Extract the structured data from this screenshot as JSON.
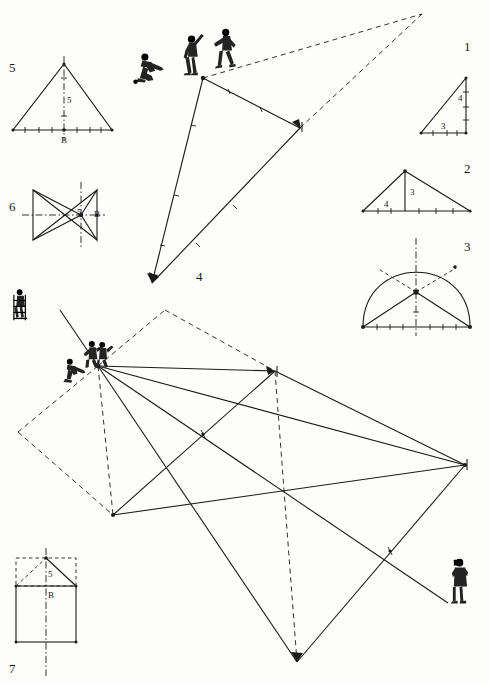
{
  "plate": {
    "title": "Perspective construction plate",
    "width": 489,
    "height": 683,
    "ink_color": "#1b1b1b",
    "paper_color": "#fdfdfc"
  },
  "figures": [
    {
      "id": "fig1",
      "number": "1",
      "name": "right-triangle",
      "number_pos": [
        464,
        40
      ],
      "dimensions": [
        {
          "text": "4",
          "pos": [
            458,
            94
          ]
        },
        {
          "text": "3",
          "pos": [
            441,
            122
          ]
        }
      ]
    },
    {
      "id": "fig2",
      "number": "2",
      "number_pos": [
        464,
        162
      ],
      "name": "isosceles-triangle-with-altitude",
      "dimensions": [
        {
          "text": "3",
          "pos": [
            410,
            192
          ]
        },
        {
          "text": "4",
          "pos": [
            384,
            206
          ]
        }
      ]
    },
    {
      "id": "fig3",
      "number": "3",
      "number_pos": [
        464,
        240
      ],
      "name": "dome-arch-with-radials",
      "dimensions": []
    },
    {
      "id": "fig4",
      "number": "4",
      "number_pos": [
        196,
        272
      ],
      "name": "large-upper-triangle-vanishing-point",
      "dimensions": []
    },
    {
      "id": "fig5",
      "number": "5",
      "number_pos": [
        10,
        62
      ],
      "name": "isosceles-triangle-centerline",
      "dimensions": [
        {
          "text": "5",
          "pos": [
            67,
            100
          ]
        },
        {
          "text": "B",
          "pos": [
            63,
            141
          ]
        }
      ]
    },
    {
      "id": "fig6",
      "number": "6",
      "number_pos": [
        10,
        201
      ],
      "name": "bowtie-hourglass-axes",
      "dimensions": [
        {
          "text": "5",
          "pos": [
            78,
            214
          ]
        },
        {
          "text": "B",
          "pos": [
            95,
            216
          ]
        }
      ]
    },
    {
      "id": "fig7",
      "number": "7",
      "number_pos": [
        10,
        665
      ],
      "name": "house-square-with-roof",
      "dimensions": [
        {
          "text": "5",
          "pos": [
            48,
            576
          ]
        },
        {
          "text": "B",
          "pos": [
            48,
            600
          ]
        }
      ]
    }
  ],
  "upper_scene": {
    "name": "upper-perspective-triangle",
    "vanishing_point": [
      422,
      14
    ],
    "station_point": [
      203,
      78
    ],
    "right_vertex": [
      300,
      128
    ],
    "bottom_vertex": [
      152,
      283
    ],
    "solid_edges": [
      {
        "from": [
          203,
          78
        ],
        "to": [
          300,
          128
        ]
      },
      {
        "from": [
          300,
          128
        ],
        "to": [
          152,
          283
        ]
      },
      {
        "from": [
          203,
          78
        ],
        "to": [
          152,
          283
        ]
      }
    ],
    "dashed_rays": [
      {
        "from": [
          203,
          78
        ],
        "to": [
          422,
          14
        ]
      },
      {
        "from": [
          300,
          128
        ],
        "to": [
          422,
          14
        ]
      }
    ],
    "tick_marks": 6
  },
  "lower_scene": {
    "name": "lower-perspective-parallelogram",
    "apex_left": [
      98,
      366
    ],
    "apex_top_dashed": [
      165,
      310
    ],
    "left_dashed_corner": [
      18,
      432
    ],
    "node_top_right": [
      275,
      371
    ],
    "node_left_low": [
      113,
      515
    ],
    "node_center": [
      203,
      434
    ],
    "node_mid_right": [
      303,
      478
    ],
    "node_far_right": [
      465,
      465
    ],
    "node_bottom": [
      297,
      662
    ],
    "node_low_mid": [
      390,
      551
    ],
    "figure_ladder_pos": [
      16,
      296
    ],
    "figure_group_pos": [
      88,
      345
    ],
    "figure_camera_pos": [
      457,
      562
    ]
  },
  "people": [
    {
      "name": "kneeling-surveyor-left",
      "pos": [
        140,
        62
      ],
      "scale": 1.0
    },
    {
      "name": "standing-assistant-center",
      "pos": [
        186,
        40
      ],
      "scale": 1.05
    },
    {
      "name": "walking-figure-right",
      "pos": [
        218,
        32
      ],
      "scale": 1.05
    },
    {
      "name": "figure-on-ladder",
      "pos": [
        14,
        292
      ],
      "scale": 1.0
    },
    {
      "name": "crouching-figure-lower-left",
      "pos": [
        68,
        364
      ],
      "scale": 0.95
    },
    {
      "name": "pair-of-figures-lower",
      "pos": [
        88,
        340
      ],
      "scale": 1.0
    },
    {
      "name": "photographer-with-camera",
      "pos": [
        455,
        560
      ],
      "scale": 1.0
    }
  ]
}
